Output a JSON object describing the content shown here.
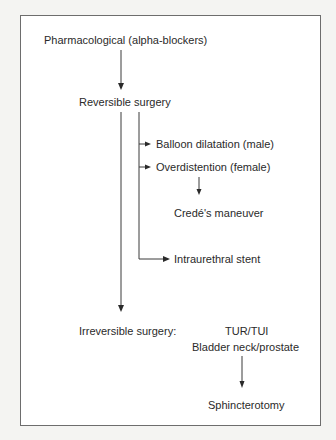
{
  "diagram": {
    "type": "flowchart",
    "nodes": {
      "pharmacological": "Pharmacological (alpha-blockers)",
      "reversible_surgery": "Reversible surgery",
      "balloon_dilatation": "Balloon dilatation (male)",
      "overdistention": "Overdistention (female)",
      "crede_maneuver": "Credé's maneuver",
      "intraurethral_stent": "Intraurethral stent",
      "irreversible_surgery": "Irreversible surgery:",
      "tur_tui": "TUR/TUI",
      "bladder_neck_prostate": "Bladder neck/prostate",
      "sphincterotomy": "Sphincterotomy"
    },
    "edges": [
      {
        "from": "pharmacological",
        "to": "reversible_surgery"
      },
      {
        "from": "reversible_surgery",
        "to": "balloon_dilatation"
      },
      {
        "from": "reversible_surgery",
        "to": "overdistention"
      },
      {
        "from": "overdistention",
        "to": "crede_maneuver"
      },
      {
        "from": "reversible_surgery",
        "to": "intraurethral_stent"
      },
      {
        "from": "reversible_surgery",
        "to": "irreversible_surgery"
      },
      {
        "from": "bladder_neck_prostate",
        "to": "sphincterotomy"
      }
    ],
    "colors": {
      "frame_border": "#6d6d6d",
      "text": "#2a2a2a",
      "line": "#3a3a3a",
      "background": "#ffffff"
    }
  }
}
